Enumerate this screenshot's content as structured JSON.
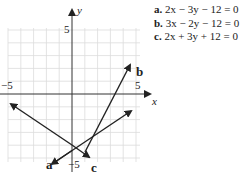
{
  "equations": [
    {
      "label": "a.",
      "text": "2x − 3y − 12 = 0"
    },
    {
      "label": "b.",
      "text": "3x − 2y − 12 = 0"
    },
    {
      "label": "c.",
      "text": "2x + 3y + 12 = 0"
    }
  ],
  "axes": {
    "x_label": "x",
    "y_label": "y",
    "tick_y_pos": "5",
    "tick_y_neg": "−5",
    "tick_x_pos": "5",
    "tick_x_neg": "−5",
    "range": [
      -5,
      5
    ]
  },
  "line_labels": {
    "a": "a",
    "b": "b",
    "c": "c"
  },
  "colors": {
    "grid": "#d8d8d8",
    "axis": "#333333",
    "line": "#222222"
  }
}
